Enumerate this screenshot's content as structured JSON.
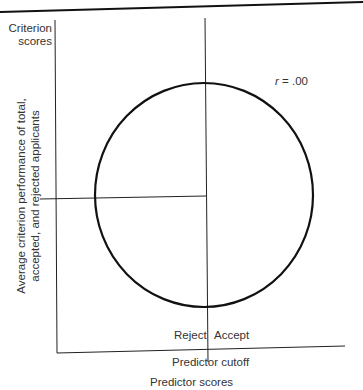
{
  "figure": {
    "y_axis_title_line1": "Criterion",
    "y_axis_title_line2": "scores",
    "y_axis_label_line1": "Average criterion performance of total,",
    "y_axis_label_line2": "accepted, and rejected applicants",
    "correlation_symbol": "r",
    "correlation_value": "= .00",
    "region_left_label": "Reject",
    "region_right_label": "Accept",
    "cutoff_label": "Predictor cutoff",
    "x_axis_title": "Predictor scores"
  },
  "diagram": {
    "type": "scatter-ellipse",
    "correlation": 0.0,
    "ellipse": {
      "shape": "circle",
      "note": "Circular scatter envelope indicating zero correlation"
    },
    "lines": [
      "predictor cutoff (vertical)",
      "average criterion performance (horizontal)"
    ],
    "colors": {
      "ink": "#111111",
      "text": "#333333",
      "background": "#ffffff"
    }
  }
}
